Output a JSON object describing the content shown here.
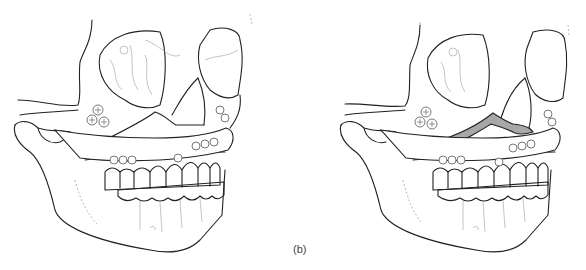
{
  "figure": {
    "panels": [
      {
        "id": "a",
        "label": "",
        "description": "Skull with Le Fort I osteotomy, maxilla fixated with plates and screws, arch bar on teeth"
      },
      {
        "id": "b",
        "label": "(b)",
        "description": "Skull after maxillary advancement showing gap (shaded) along osteotomy line, fixated with plates and screws"
      }
    ],
    "colors": {
      "line": "#222222",
      "detail": "#aaaaaa",
      "gap_fill": "#a8a8a8",
      "background": "#ffffff"
    }
  }
}
